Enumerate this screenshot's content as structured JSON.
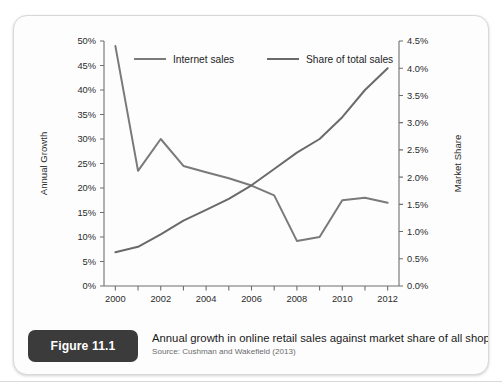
{
  "figure": {
    "badge_label": "Figure 11.1",
    "caption_title": "Annual growth in online retail sales against market share of all shopping",
    "caption_source": "Source: Cushman and Wakefield (2013)"
  },
  "colors": {
    "line_internet_sales": "#7a7a7a",
    "line_share_total_sales": "#6a6a6a",
    "axis": "#6f6f6f",
    "badge_bg": "#3b3b3b",
    "card_bg": "#fdfdfd"
  },
  "chart_data": {
    "type": "line",
    "title": "Annual growth in online retail sales against market share of all shopping",
    "xlabel": "",
    "ylabel": "Annual Growth",
    "y2label": "Market Share",
    "grid": false,
    "legend_position": "top",
    "x": [
      2000,
      2001,
      2002,
      2003,
      2004,
      2005,
      2006,
      2007,
      2008,
      2009,
      2010,
      2011,
      2012
    ],
    "xlim": [
      1999.5,
      2012.5
    ],
    "xticks": [
      2000,
      2001,
      2002,
      2003,
      2004,
      2005,
      2006,
      2007,
      2008,
      2009,
      2010,
      2011,
      2012
    ],
    "xtick_labels": [
      "2000",
      "",
      "2002",
      "",
      "2004",
      "",
      "2006",
      "",
      "2008",
      "",
      "2010",
      "",
      "2012"
    ],
    "ylim": [
      0,
      50
    ],
    "yticks": [
      0,
      5,
      10,
      15,
      20,
      25,
      30,
      35,
      40,
      45,
      50
    ],
    "ytick_labels": [
      "0%",
      "5%",
      "10%",
      "15%",
      "20%",
      "25%",
      "30%",
      "35%",
      "40%",
      "45%",
      "50%"
    ],
    "y2lim": [
      0.0,
      4.5
    ],
    "y2ticks": [
      0.0,
      0.5,
      1.0,
      1.5,
      2.0,
      2.5,
      3.0,
      3.5,
      4.0,
      4.5
    ],
    "y2tick_labels": [
      "0.0%",
      "0.5%",
      "1.0%",
      "1.5%",
      "2.0%",
      "2.5%",
      "3.0%",
      "3.5%",
      "4.0%",
      "4.5%"
    ],
    "series": [
      {
        "name": "Internet sales",
        "axis": "left",
        "unit": "%",
        "values": [
          49.0,
          23.5,
          30.0,
          24.5,
          23.2,
          22.0,
          20.5,
          18.5,
          9.2,
          10.0,
          17.5,
          18.0,
          17.0
        ]
      },
      {
        "name": "Share of total sales",
        "axis": "right",
        "unit": "%",
        "values": [
          0.62,
          0.72,
          0.95,
          1.2,
          1.4,
          1.6,
          1.85,
          2.15,
          2.45,
          2.7,
          3.1,
          3.6,
          4.0
        ]
      }
    ]
  }
}
